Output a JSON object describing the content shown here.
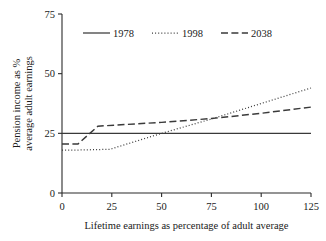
{
  "chart_data": {
    "type": "line",
    "title": "",
    "subtitle": "",
    "xlabel": "Lifetime earnings as percentage of adult average",
    "ylabel": "Pension income as % average adult earnings",
    "ylabel_line1": "Pension income as %",
    "ylabel_line2": "average adult earnings",
    "xlim": [
      0,
      125
    ],
    "ylim": [
      0,
      75
    ],
    "xticks": [
      0,
      25,
      50,
      75,
      100,
      125
    ],
    "yticks": [
      0,
      25,
      50,
      75
    ],
    "xtick_labels": [
      "0",
      "25",
      "50",
      "75",
      "100",
      "125"
    ],
    "ytick_labels": [
      "0",
      "25",
      "50",
      "75"
    ],
    "grid": false,
    "legend_position": "top-center",
    "series": [
      {
        "name": "1978",
        "style": "solid",
        "color": "#3a3a3a",
        "x": [
          0,
          25,
          50,
          75,
          100,
          125
        ],
        "values": [
          25,
          25,
          25,
          25,
          25,
          25
        ]
      },
      {
        "name": "1998",
        "style": "dotted",
        "color": "#3a3a3a",
        "x": [
          0,
          8,
          24,
          50,
          75,
          100,
          125
        ],
        "values": [
          18,
          18,
          18.3,
          25,
          31,
          37.5,
          44
        ]
      },
      {
        "name": "2038",
        "style": "dashed",
        "color": "#3a3a3a",
        "x": [
          0,
          8,
          18,
          50,
          75,
          100,
          125
        ],
        "values": [
          20.5,
          20.5,
          28,
          29.6,
          31.2,
          33.4,
          36
        ]
      }
    ]
  },
  "legend": {
    "entries": [
      {
        "label": "1978",
        "style": "solid"
      },
      {
        "label": "1998",
        "style": "dotted"
      },
      {
        "label": "2038",
        "style": "dashed"
      }
    ]
  }
}
